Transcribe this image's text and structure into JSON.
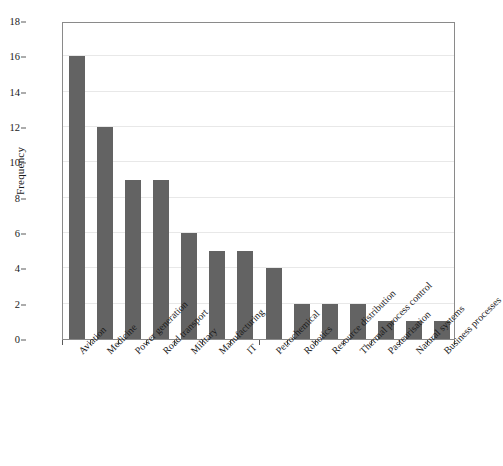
{
  "chart_data": {
    "type": "bar",
    "title": "",
    "xlabel": "",
    "ylabel": "Frequency",
    "ylim": [
      0,
      18
    ],
    "ytick_step": 2,
    "yticks": [
      0,
      2,
      4,
      6,
      8,
      10,
      12,
      14,
      16,
      18
    ],
    "grid": true,
    "grid_axis": "y",
    "legend": false,
    "bar_color": "#636363",
    "categories": [
      "Aviation",
      "Medicine",
      "Power generation",
      "Road transport",
      "Military",
      "Manufacturing",
      "IT",
      "Petrochemical",
      "Robotics",
      "Resource distribution",
      "Thermal process control",
      "Pasteurisation",
      "Natural systems",
      "Business processes"
    ],
    "values": [
      16,
      12,
      9,
      9,
      6,
      5,
      5,
      4,
      2,
      2,
      2,
      1,
      1,
      1
    ]
  },
  "axes": {
    "y_title": "Frequency",
    "frame_color": "#8a8a8a",
    "gridline_color": "#e8e8e8",
    "tick_color": "#5a5a5a"
  }
}
